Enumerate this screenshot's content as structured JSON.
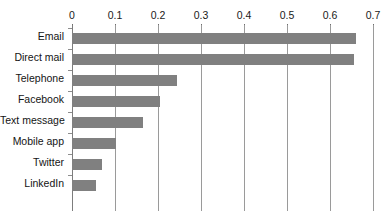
{
  "chart_data": {
    "type": "bar",
    "orientation": "horizontal",
    "title": "",
    "xlabel": "",
    "ylabel": "",
    "xlim": [
      0,
      0.7
    ],
    "grid": "vertical",
    "legend": "none",
    "bar_color": "#808080",
    "gridline_color": "#9a9a9a",
    "xticks": [
      0,
      0.1,
      0.2,
      0.3,
      0.4,
      0.5,
      0.6,
      0.7
    ],
    "xtick_labels": [
      "0",
      "0.1",
      "0.2",
      "0.3",
      "0.4",
      "0.5",
      "0.6",
      "0.7"
    ],
    "categories": [
      "Email",
      "Direct mail",
      "Telephone",
      "Facebook",
      "Text message",
      "Mobile app",
      "Twitter",
      "LinkedIn"
    ],
    "values": [
      0.66,
      0.655,
      0.245,
      0.205,
      0.165,
      0.102,
      0.07,
      0.055
    ]
  }
}
